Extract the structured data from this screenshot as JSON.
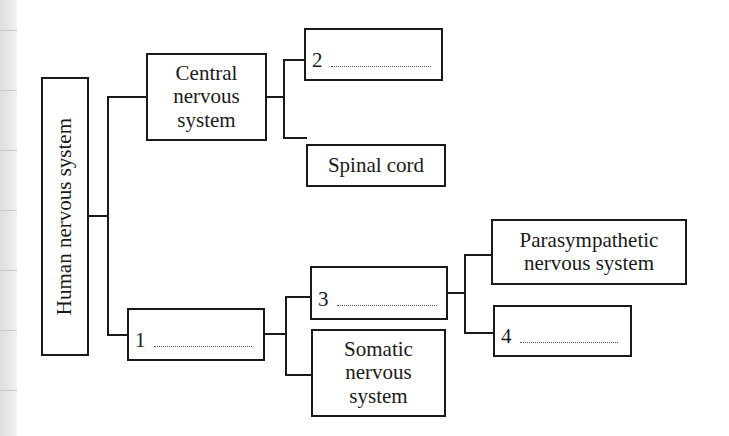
{
  "diagram": {
    "root": {
      "label": "Human nervous system"
    },
    "central": {
      "label_lines": [
        "Central",
        "nervous",
        "system"
      ]
    },
    "blank1": {
      "number": "1"
    },
    "blank2": {
      "number": "2"
    },
    "spinal_cord": {
      "label": "Spinal cord"
    },
    "blank3": {
      "number": "3"
    },
    "somatic": {
      "label_lines": [
        "Somatic",
        "nervous",
        "system"
      ]
    },
    "parasympathetic": {
      "label_lines": [
        "Parasympathetic",
        "nervous system"
      ]
    },
    "blank4": {
      "number": "4"
    }
  },
  "colors": {
    "stroke": "#1a1a1a",
    "background": "#ffffff",
    "margin": "#e6e6e6"
  }
}
